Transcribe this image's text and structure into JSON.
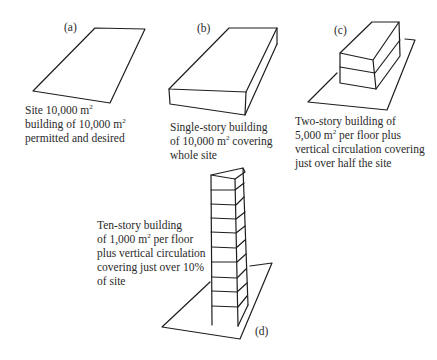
{
  "figure": {
    "panels": [
      {
        "id": "a",
        "tag": "(a)",
        "caption_lines": [
          {
            "pre": "Site 10,000 m",
            "sup": "2",
            "post": ""
          },
          {
            "pre": "building of 10,000 m",
            "sup": "2",
            "post": ""
          },
          {
            "pre": "permitted and desired",
            "sup": "",
            "post": ""
          }
        ]
      },
      {
        "id": "b",
        "tag": "(b)",
        "caption_lines": [
          {
            "pre": "Single-story building",
            "sup": "",
            "post": ""
          },
          {
            "pre": "of 10,000 m",
            "sup": "2",
            "post": " covering"
          },
          {
            "pre": "whole site",
            "sup": "",
            "post": ""
          }
        ]
      },
      {
        "id": "c",
        "tag": "(c)",
        "caption_lines": [
          {
            "pre": "Two-story building of",
            "sup": "",
            "post": ""
          },
          {
            "pre": "5,000 m",
            "sup": "2",
            "post": " per floor plus"
          },
          {
            "pre": "vertical circulation covering",
            "sup": "",
            "post": ""
          },
          {
            "pre": "just over half the site",
            "sup": "",
            "post": ""
          }
        ]
      },
      {
        "id": "d",
        "tag": "(d)",
        "caption_lines": [
          {
            "pre": "Ten-story building",
            "sup": "",
            "post": ""
          },
          {
            "pre": "of 1,000 m",
            "sup": "2",
            "post": " per floor"
          },
          {
            "pre": "plus vertical circulation",
            "sup": "",
            "post": ""
          },
          {
            "pre": "covering just over 10%",
            "sup": "",
            "post": ""
          },
          {
            "pre": "of site",
            "sup": "",
            "post": ""
          }
        ]
      }
    ],
    "colors": {
      "ink": "#1e1e1e",
      "text": "#2a2a2a",
      "background": "#ffffff"
    }
  }
}
